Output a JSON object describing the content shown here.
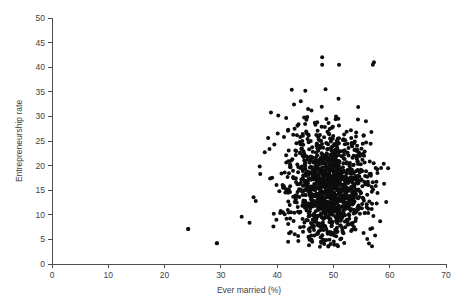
{
  "chart_data": {
    "type": "scatter",
    "title": "",
    "xlabel": "Ever married (%)",
    "ylabel": "Entrepreneurship rate",
    "xlim": [
      0,
      70
    ],
    "ylim": [
      0,
      50
    ],
    "xticks": [
      0,
      10,
      20,
      30,
      40,
      50,
      60,
      70
    ],
    "yticks": [
      0,
      5,
      10,
      15,
      20,
      25,
      30,
      35,
      40,
      45,
      50
    ],
    "xtick_labels": [
      "0",
      "10",
      "20",
      "30",
      "40",
      "50",
      "60",
      "70"
    ],
    "ytick_labels": [
      "0",
      "5",
      "10",
      "15",
      "20",
      "25",
      "30",
      "35",
      "40",
      "45",
      "50"
    ],
    "grid": false,
    "legend": null,
    "marker": {
      "shape": "circle",
      "color": "#0d0d0d",
      "size": 2.0
    },
    "n_points": 1280,
    "series": [
      {
        "name": "observations",
        "x": [
          44.3,
          45.1,
          45.0,
          52.3,
          57.2,
          39.5,
          41.6,
          45.8,
          47.5,
          49.2,
          43.1,
          50.4,
          46.9,
          52.8,
          40.2,
          36.9,
          38.4,
          42.7,
          44.9,
          48.1,
          51.0,
          53.2,
          55.1,
          47.3,
          45.6,
          43.8,
          49.7,
          50.9,
          52.1,
          54.3,
          24.2,
          29.3,
          33.7,
          35.1,
          36.2,
          37.0,
          37.8,
          38.9,
          39.4,
          40.1,
          41.2,
          42.0,
          42.6,
          43.3,
          44.0,
          44.5,
          45.2,
          45.9,
          46.4,
          47.0,
          47.6,
          48.2,
          48.8,
          49.3,
          49.9,
          50.5,
          51.1,
          51.7,
          52.2,
          52.9,
          53.5,
          54.0,
          54.6,
          55.3,
          56.0,
          56.8,
          57.5,
          58.3,
          59.0,
          46.1,
          46.7,
          47.2,
          47.9,
          48.5,
          49.0,
          49.6,
          50.1,
          50.7,
          51.3,
          51.9,
          52.5,
          53.0,
          53.6,
          44.2,
          44.8,
          45.4,
          46.0,
          46.6,
          47.1,
          47.7,
          48.3,
          48.9,
          49.5,
          50.0,
          50.6,
          51.2,
          51.8,
          52.4,
          53.1,
          53.7,
          54.2,
          42.3,
          43.0,
          43.6,
          44.1
        ],
        "y": [
          17.2,
          16.4,
          18.1,
          14.7,
          41.0,
          24.3,
          22.1,
          19.6,
          15.3,
          13.8,
          27.5,
          12.6,
          20.4,
          11.9,
          30.2,
          19.8,
          25.6,
          21.3,
          16.9,
          18.7,
          15.1,
          13.4,
          12.2,
          23.0,
          26.1,
          28.4,
          17.6,
          16.2,
          14.9,
          11.5,
          7.1,
          4.2,
          9.6,
          8.4,
          12.8,
          18.3,
          22.7,
          30.8,
          10.2,
          26.5,
          15.8,
          20.9,
          35.4,
          13.1,
          24.8,
          17.4,
          29.3,
          11.7,
          19.2,
          14.3,
          23.6,
          16.1,
          21.8,
          12.4,
          27.9,
          18.9,
          10.8,
          25.2,
          15.5,
          13.7,
          20.1,
          9.3,
          17.8,
          22.4,
          14.1,
          11.2,
          19.5,
          8.7,
          16.3,
          31.2,
          28.7,
          24.1,
          20.6,
          18.0,
          15.9,
          13.3,
          11.6,
          10.1,
          22.9,
          26.3,
          19.1,
          17.0,
          14.5,
          33.1,
          29.8,
          25.4,
          21.1,
          18.6,
          16.7,
          12.9,
          10.4,
          23.3,
          20.2,
          17.5,
          15.0,
          13.0,
          11.0,
          9.0,
          27.2,
          24.6,
          22.0,
          19.7,
          32.4,
          28.1,
          25.8
        ]
      }
    ],
    "outliers": [
      {
        "x": 48.0,
        "y": 42.0
      },
      {
        "x": 48.0,
        "y": 40.5
      },
      {
        "x": 51.0,
        "y": 40.5
      },
      {
        "x": 57.0,
        "y": 40.5
      },
      {
        "x": 45.0,
        "y": 35.2
      },
      {
        "x": 48.6,
        "y": 35.5
      },
      {
        "x": 24.2,
        "y": 7.1
      },
      {
        "x": 29.3,
        "y": 4.2
      }
    ],
    "cluster": {
      "center_x": 49.5,
      "center_y": 15.5,
      "spread_x": 3.4,
      "spread_y": 5.1,
      "x_range": [
        34.0,
        60.0
      ],
      "y_range": [
        3.5,
        36.0
      ]
    }
  }
}
